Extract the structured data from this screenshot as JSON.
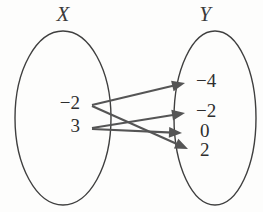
{
  "diagram": {
    "type": "mapping-diagram",
    "colors": {
      "background": "#fdfdfc",
      "ellipse_stroke": "#3f3f3f",
      "arrow": "#555555",
      "label_text": "#2e2e2e",
      "title_text": "#3a3a3a"
    },
    "sets": {
      "domain": {
        "title": "X",
        "title_x": 63,
        "title_y": 16,
        "ellipse": {
          "cx": 63,
          "cy": 118,
          "rx": 48,
          "ry": 87
        },
        "elements": [
          {
            "label": "−2",
            "x": 80,
            "y": 105
          },
          {
            "label": "3",
            "x": 80,
            "y": 128
          }
        ]
      },
      "codomain": {
        "title": "Y",
        "title_x": 205,
        "title_y": 16,
        "ellipse": {
          "cx": 215,
          "cy": 118,
          "rx": 41,
          "ry": 87
        },
        "elements": [
          {
            "label": "−4",
            "x": 196,
            "y": 83
          },
          {
            "label": "−2",
            "x": 196,
            "y": 113
          },
          {
            "label": "0",
            "x": 200,
            "y": 133
          },
          {
            "label": "2",
            "x": 200,
            "y": 152
          }
        ]
      }
    },
    "arrows": [
      {
        "from": "−2",
        "to": "−4",
        "x1": 92,
        "y1": 105,
        "x2": 185,
        "y2": 83
      },
      {
        "from": "−2",
        "to": "2",
        "x1": 92,
        "y1": 106,
        "x2": 188,
        "y2": 149
      },
      {
        "from": "3",
        "to": "−2",
        "x1": 92,
        "y1": 128,
        "x2": 185,
        "y2": 113
      },
      {
        "from": "3",
        "to": "0",
        "x1": 92,
        "y1": 129,
        "x2": 182,
        "y2": 133
      }
    ]
  }
}
